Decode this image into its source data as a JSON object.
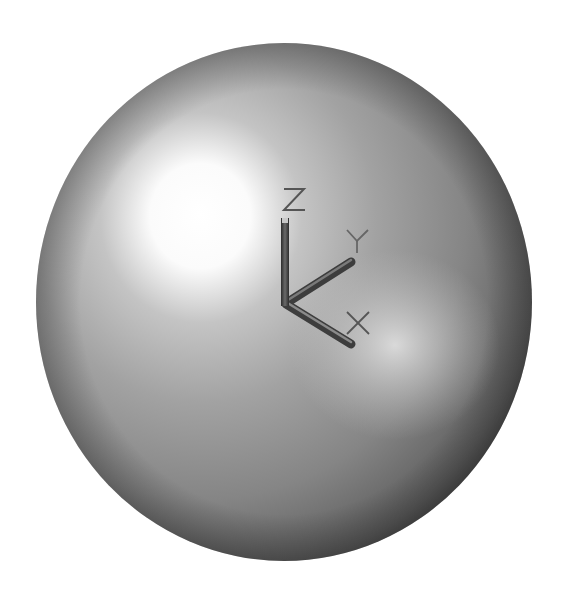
{
  "viewport": {
    "background": "#ffffff",
    "object": "sphere",
    "sphere": {
      "cx": 284,
      "cy": 302,
      "rx": 248,
      "ry": 259,
      "highlight_color": "#ffffff",
      "mid_color": "#9c9c9c",
      "shadow_color": "#3e3e3e"
    }
  },
  "axis_triad": {
    "labels": {
      "z": "Z",
      "y": "Y",
      "x": "X"
    },
    "bar_color": "#4a4a4a",
    "label_color": "#555555",
    "origin": [
      285,
      304
    ]
  }
}
